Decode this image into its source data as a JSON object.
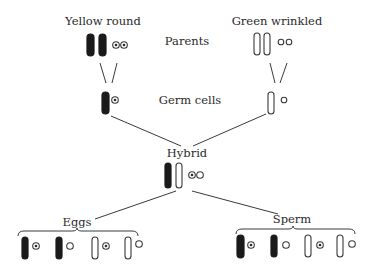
{
  "labels": {
    "yellow_round": "Yellow round",
    "green_wrinkled": "Green wrinkled",
    "parents": "Parents",
    "germ_cells": "Germ cells",
    "hybrid": "Hybrid",
    "eggs": "Eggs",
    "sperm": "Sperm"
  },
  "rows": {
    "parents": [
      {
        "name": "yellow-round-parent",
        "chromosomes": [
          "dark",
          "dark"
        ],
        "seeds": [
          "dotted",
          "dotted"
        ]
      },
      {
        "name": "green-wrinkled-parent",
        "chromosomes": [
          "light",
          "light"
        ],
        "seeds": [
          "plain",
          "plain"
        ]
      }
    ],
    "germ_cells": [
      {
        "name": "yellow-germ-cell",
        "chromosomes": [
          "dark"
        ],
        "seeds": [
          "dotted"
        ]
      },
      {
        "name": "green-germ-cell",
        "chromosomes": [
          "light"
        ],
        "seeds": [
          "plain"
        ]
      }
    ],
    "hybrid": {
      "chromosomes": [
        "dark",
        "light"
      ],
      "seeds": [
        "dotted",
        "plain"
      ]
    },
    "eggs": [
      {
        "chromosome": "dark",
        "seed": "dotted"
      },
      {
        "chromosome": "dark",
        "seed": "plain"
      },
      {
        "chromosome": "light",
        "seed": "dotted"
      },
      {
        "chromosome": "light",
        "seed": "plain"
      }
    ],
    "sperm": [
      {
        "chromosome": "dark",
        "seed": "dotted"
      },
      {
        "chromosome": "dark",
        "seed": "plain"
      },
      {
        "chromosome": "light",
        "seed": "dotted"
      },
      {
        "chromosome": "light",
        "seed": "plain"
      }
    ]
  }
}
